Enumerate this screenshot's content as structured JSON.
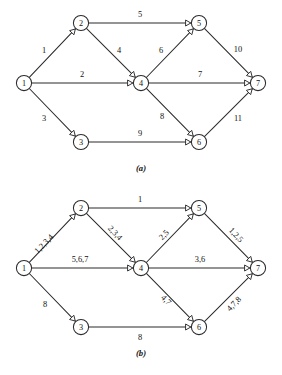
{
  "figure": {
    "background_color": "#ffffff",
    "ink_color": "#2b2b2b",
    "panels": [
      {
        "id": "a",
        "caption": "(a)",
        "caption_x": 141,
        "caption_y": 168,
        "label_style": "upright",
        "nodes": [
          {
            "id": "n1",
            "label": "1",
            "x": 24,
            "y": 83,
            "r": 7.6
          },
          {
            "id": "n2",
            "label": "2",
            "x": 81,
            "y": 23,
            "r": 7.6
          },
          {
            "id": "n3",
            "label": "3",
            "x": 81,
            "y": 142,
            "r": 7.6
          },
          {
            "id": "n4",
            "label": "4",
            "x": 141,
            "y": 83,
            "r": 7.6
          },
          {
            "id": "n5",
            "label": "5",
            "x": 199,
            "y": 23,
            "r": 7.6
          },
          {
            "id": "n6",
            "label": "6",
            "x": 199,
            "y": 142,
            "r": 7.6
          },
          {
            "id": "n7",
            "label": "7",
            "x": 258,
            "y": 83,
            "r": 7.6
          }
        ],
        "edges": [
          {
            "id": "e-1-2",
            "from": "n1",
            "to": "n2",
            "label": "1",
            "lx": 44,
            "ly": 50,
            "rotate": 0
          },
          {
            "id": "e-1-4",
            "from": "n1",
            "to": "n4",
            "label": "2",
            "lx": 82,
            "ly": 74,
            "rotate": 0
          },
          {
            "id": "e-1-3",
            "from": "n1",
            "to": "n3",
            "label": "3",
            "lx": 44,
            "ly": 118,
            "rotate": 0
          },
          {
            "id": "e-2-5",
            "from": "n2",
            "to": "n5",
            "label": "5",
            "lx": 140,
            "ly": 14,
            "rotate": 0
          },
          {
            "id": "e-2-4",
            "from": "n2",
            "to": "n4",
            "label": "4",
            "lx": 119,
            "ly": 50,
            "rotate": 0
          },
          {
            "id": "e-4-5",
            "from": "n4",
            "to": "n5",
            "label": "6",
            "lx": 161,
            "ly": 50,
            "rotate": 0
          },
          {
            "id": "e-4-7",
            "from": "n4",
            "to": "n7",
            "label": "7",
            "lx": 200,
            "ly": 74,
            "rotate": 0
          },
          {
            "id": "e-4-6",
            "from": "n4",
            "to": "n6",
            "label": "8",
            "lx": 162,
            "ly": 116,
            "rotate": 0
          },
          {
            "id": "e-3-6",
            "from": "n3",
            "to": "n6",
            "label": "9",
            "lx": 140,
            "ly": 133,
            "rotate": 0
          },
          {
            "id": "e-5-7",
            "from": "n5",
            "to": "n7",
            "label": "10",
            "lx": 238,
            "ly": 49,
            "rotate": 0
          },
          {
            "id": "e-6-7",
            "from": "n6",
            "to": "n7",
            "label": "11",
            "lx": 238,
            "ly": 118,
            "rotate": 0
          }
        ]
      },
      {
        "id": "b",
        "caption": "(b)",
        "caption_x": 141,
        "caption_y": 168,
        "label_style": "rotated-on-diagonals",
        "nodes": [
          {
            "id": "n1",
            "label": "1",
            "x": 24,
            "y": 83,
            "r": 7.6
          },
          {
            "id": "n2",
            "label": "2",
            "x": 81,
            "y": 23,
            "r": 7.6
          },
          {
            "id": "n3",
            "label": "3",
            "x": 81,
            "y": 142,
            "r": 7.6
          },
          {
            "id": "n4",
            "label": "4",
            "x": 141,
            "y": 83,
            "r": 7.6
          },
          {
            "id": "n5",
            "label": "5",
            "x": 199,
            "y": 23,
            "r": 7.6
          },
          {
            "id": "n6",
            "label": "6",
            "x": 199,
            "y": 142,
            "r": 7.6
          },
          {
            "id": "n7",
            "label": "7",
            "x": 258,
            "y": 83,
            "r": 7.6
          }
        ],
        "edges": [
          {
            "id": "e-1-2",
            "from": "n1",
            "to": "n2",
            "label": "1,2,3,4",
            "lx": 44,
            "ly": 59,
            "rotate": -46
          },
          {
            "id": "e-1-4",
            "from": "n1",
            "to": "n4",
            "label": "5,6,7",
            "lx": 80,
            "ly": 74,
            "rotate": 0
          },
          {
            "id": "e-1-3",
            "from": "n1",
            "to": "n3",
            "label": "8",
            "lx": 45,
            "ly": 119,
            "rotate": 0
          },
          {
            "id": "e-2-5",
            "from": "n2",
            "to": "n5",
            "label": "1",
            "lx": 140,
            "ly": 14,
            "rotate": 0
          },
          {
            "id": "e-2-4",
            "from": "n2",
            "to": "n4",
            "label": "2,3,4",
            "lx": 115,
            "ly": 48,
            "rotate": 46
          },
          {
            "id": "e-4-5",
            "from": "n4",
            "to": "n5",
            "label": "2,5",
            "lx": 164,
            "ly": 50,
            "rotate": -46
          },
          {
            "id": "e-4-7",
            "from": "n4",
            "to": "n7",
            "label": "3,6",
            "lx": 200,
            "ly": 74,
            "rotate": 0
          },
          {
            "id": "e-4-6",
            "from": "n4",
            "to": "n6",
            "label": "4,7",
            "lx": 166,
            "ly": 115,
            "rotate": 46
          },
          {
            "id": "e-3-6",
            "from": "n3",
            "to": "n6",
            "label": "8",
            "lx": 140,
            "ly": 152,
            "rotate": 0
          },
          {
            "id": "e-5-7",
            "from": "n5",
            "to": "n7",
            "label": "1,2,5",
            "lx": 236,
            "ly": 50,
            "rotate": 46
          },
          {
            "id": "e-6-7",
            "from": "n6",
            "to": "n7",
            "label": "4,7,8",
            "lx": 234,
            "ly": 119,
            "rotate": -46
          }
        ]
      }
    ]
  }
}
